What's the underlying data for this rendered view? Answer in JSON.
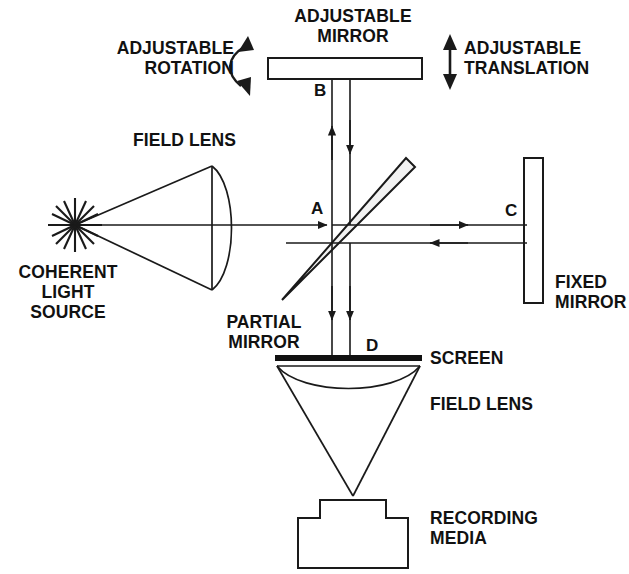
{
  "diagram": {
    "labels": {
      "adjustable_mirror": "ADJUSTABLE\nMIRROR",
      "adjustable_rotation": "ADJUSTABLE\nROTATION",
      "adjustable_translation": "ADJUSTABLE\nTRANSLATION",
      "field_lens_top": "FIELD LENS",
      "coherent_light_source": "COHERENT\nLIGHT\nSOURCE",
      "partial_mirror": "PARTIAL\nMIRROR",
      "fixed_mirror": "FIXED\nMIRROR",
      "screen": "SCREEN",
      "field_lens_bottom": "FIELD LENS",
      "recording_media": "RECORDING\nMEDIA"
    },
    "point_labels": {
      "a": "A",
      "b": "B",
      "c": "C",
      "d": "D"
    },
    "colors": {
      "ink": "#1a1a1a",
      "background": "#ffffff",
      "splitter_fill": "#f2f2f2",
      "screen_fill": "#111111"
    },
    "components": [
      {
        "name": "coherent-light-source",
        "kind": "point-source",
        "x": 75,
        "y": 225
      },
      {
        "name": "field-lens-top",
        "kind": "plano-convex-lens",
        "orientation": "vertical"
      },
      {
        "name": "partial-mirror",
        "kind": "beam-splitter",
        "angle_deg": 45
      },
      {
        "name": "adjustable-mirror",
        "kind": "flat-mirror",
        "orientation": "horizontal",
        "point": "B"
      },
      {
        "name": "fixed-mirror",
        "kind": "flat-mirror",
        "orientation": "vertical",
        "point": "C"
      },
      {
        "name": "screen",
        "kind": "screen",
        "point": "D"
      },
      {
        "name": "field-lens-bottom",
        "kind": "plano-convex-lens",
        "orientation": "horizontal"
      },
      {
        "name": "recording-media",
        "kind": "recording-media"
      }
    ],
    "beam_paths": [
      {
        "name": "source-to-splitter",
        "direction": "right"
      },
      {
        "name": "splitter-to-adjustable-mirror",
        "direction": "up"
      },
      {
        "name": "adjustable-mirror-to-splitter",
        "direction": "down"
      },
      {
        "name": "splitter-to-fixed-mirror",
        "direction": "right"
      },
      {
        "name": "fixed-mirror-to-splitter",
        "direction": "left"
      },
      {
        "name": "splitter-to-screen-left",
        "direction": "down"
      },
      {
        "name": "splitter-to-screen-right",
        "direction": "down"
      }
    ]
  }
}
